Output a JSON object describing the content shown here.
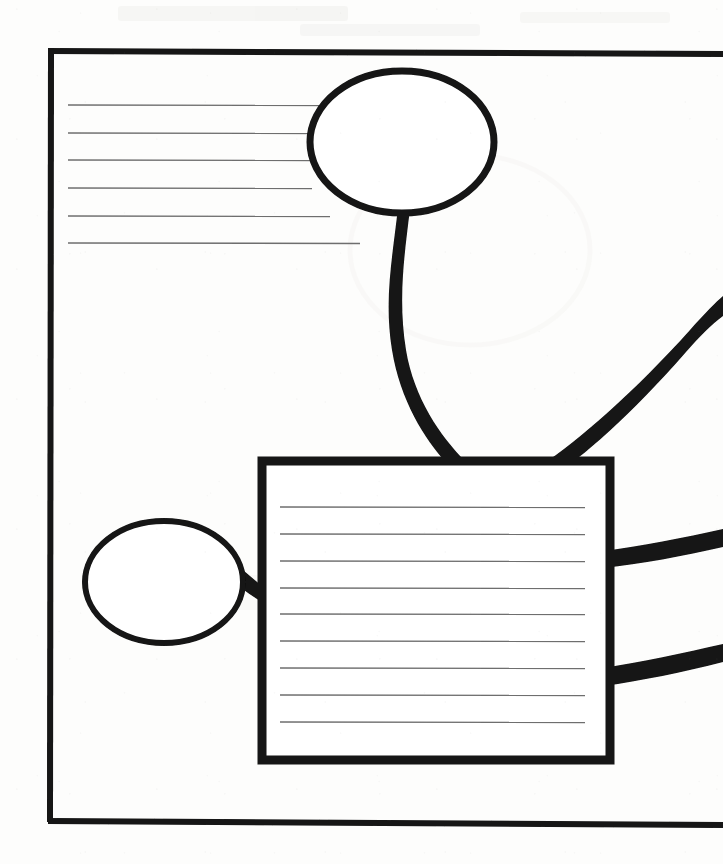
{
  "document": {
    "title": "Hand-drawn concept map worksheet",
    "medium": "scanned ink on paper",
    "ink_color": "#111111",
    "rule_line_color": "#6e6e6e",
    "paper_color": "#fdfdfc",
    "canvas": {
      "width": 723,
      "height": 864
    }
  },
  "frame": {
    "name": "outer-page-border",
    "left": 48,
    "top": 48,
    "right_edge_visible": false,
    "bottom": 822,
    "stroke_width": 6,
    "note": "Border is open on the right side; top and bottom rules run off the right edge of the page."
  },
  "nodes": [
    {
      "id": "top-oval",
      "shape": "ellipse",
      "label": "",
      "cx": 402,
      "cy": 142,
      "rx": 92,
      "ry": 71,
      "stroke_width": 7,
      "fill": "none"
    },
    {
      "id": "left-oval",
      "shape": "ellipse",
      "label": "",
      "cx": 164,
      "cy": 582,
      "rx": 79,
      "ry": 61,
      "stroke_width": 6,
      "fill": "none"
    },
    {
      "id": "center-box",
      "shape": "rectangle",
      "label": "",
      "x": 262,
      "y": 461,
      "width": 348,
      "height": 299,
      "stroke_width": 9,
      "fill": "none",
      "ruled_lines": 9
    }
  ],
  "writing_lines": {
    "top_left_group": {
      "name": "top-left-rule-lines",
      "count": 6,
      "x_start": 68,
      "x_end": 330,
      "y_values": [
        105,
        133,
        160,
        188,
        216,
        243
      ],
      "stroke_width": 1.4
    },
    "box_group": {
      "name": "center-box-rule-lines",
      "count": 9,
      "x_start": 280,
      "x_end": 585,
      "y_values": [
        507,
        534,
        561,
        588,
        614,
        641,
        668,
        695,
        722
      ],
      "stroke_width": 1.4
    }
  },
  "connectors": [
    {
      "id": "top-oval-to-box",
      "name": "connector-top-oval-to-box",
      "from": "top-oval",
      "to": "center-box",
      "style": "curved-tapered",
      "stroke_width_start": 9,
      "stroke_width_end": 14
    },
    {
      "id": "left-oval-to-box",
      "name": "connector-left-oval-to-box",
      "from": "left-oval",
      "to": "center-box",
      "style": "short-stub",
      "stroke_width_start": 7,
      "stroke_width_end": 12
    },
    {
      "id": "box-to-upper-right",
      "name": "connector-box-to-upper-right",
      "from": "center-box",
      "to": "off-page-upper-right",
      "style": "curved-tapered",
      "stroke_width_start": 17,
      "stroke_width_end": 11
    },
    {
      "id": "box-to-middle-right",
      "name": "connector-box-to-middle-right",
      "from": "center-box",
      "to": "off-page-middle-right",
      "style": "curved-tapered",
      "stroke_width_start": 16,
      "stroke_width_end": 12
    },
    {
      "id": "box-to-lower-right",
      "name": "connector-box-to-lower-right",
      "from": "center-box",
      "to": "off-page-lower-right",
      "style": "curved-tapered",
      "stroke_width_start": 16,
      "stroke_width_end": 12
    }
  ],
  "background_ghosting": [
    {
      "id": "ghost-line-1",
      "text": "",
      "x": 120,
      "y": 18,
      "size": 19
    },
    {
      "id": "ghost-line-2",
      "text": "",
      "x": 300,
      "y": 34,
      "size": 17
    },
    {
      "id": "ghost-line-3",
      "text": "",
      "x": 430,
      "y": 250,
      "size": 15
    },
    {
      "id": "ghost-line-4",
      "text": "",
      "x": 120,
      "y": 585,
      "size": 15
    }
  ]
}
